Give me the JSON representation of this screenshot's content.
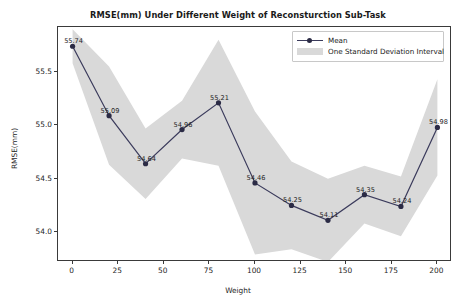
{
  "chart_data": {
    "type": "line",
    "title": "RMSE(mm) Under Different Weight of Reconsturction Sub-Task",
    "xlabel": "Weight",
    "ylabel": "RMSE(mm)",
    "x": [
      0,
      20,
      40,
      60,
      80,
      100,
      120,
      140,
      160,
      180,
      200
    ],
    "xlim": [
      -8,
      208
    ],
    "ylim": [
      53.72,
      55.92
    ],
    "xticks": [
      "0",
      "25",
      "50",
      "75",
      "100",
      "125",
      "150",
      "175",
      "200"
    ],
    "xtick_values": [
      0,
      25,
      50,
      75,
      100,
      125,
      150,
      175,
      200
    ],
    "yticks": [
      "54.0",
      "54.5",
      "55.0",
      "55.5"
    ],
    "ytick_values": [
      54.0,
      54.5,
      55.0,
      55.5
    ],
    "grid": false,
    "legend_position": "upper right",
    "series": [
      {
        "name": "Mean",
        "values": [
          55.74,
          55.09,
          54.64,
          54.96,
          55.21,
          54.46,
          54.25,
          54.11,
          54.35,
          54.24,
          54.98
        ],
        "point_labels": [
          "55.74",
          "55.09",
          "54.64",
          "54.96",
          "55.21",
          "54.46",
          "54.25",
          "54.11",
          "54.35",
          "54.24",
          "54.98"
        ],
        "color": "#2b2b45",
        "marker": "circle"
      },
      {
        "name": "One Standard Deviation Interval",
        "upper": [
          55.9,
          55.55,
          54.97,
          55.23,
          55.8,
          55.13,
          54.66,
          54.5,
          54.62,
          54.52,
          55.43
        ],
        "lower": [
          55.58,
          54.63,
          54.31,
          54.69,
          54.62,
          53.79,
          53.84,
          53.72,
          54.08,
          53.96,
          54.53
        ],
        "color": "#d9d9d9"
      }
    ]
  },
  "legend": {
    "entries": [
      {
        "label": "Mean"
      },
      {
        "label": "One Standard Deviation Interval"
      }
    ]
  }
}
